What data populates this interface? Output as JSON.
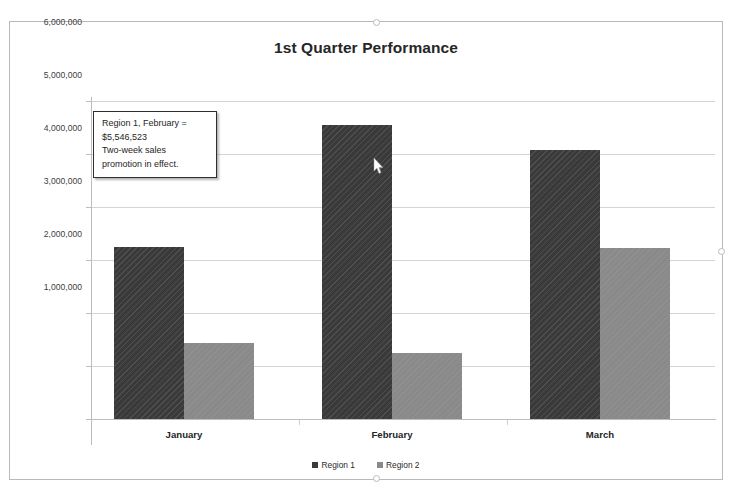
{
  "chart_data": {
    "type": "bar",
    "title": "1st Quarter Performance",
    "xlabel": "",
    "ylabel": "",
    "categories": [
      "January",
      "February",
      "March"
    ],
    "series": [
      {
        "name": "Region 1",
        "color": "#3a3a3a",
        "values": [
          3240000,
          5546523,
          5070000
        ]
      },
      {
        "name": "Region 2",
        "color": "#8a8a8a",
        "values": [
          1430000,
          1250000,
          3220000
        ]
      }
    ],
    "ylim": [
      0,
      6000000
    ],
    "ytick_values": [
      0,
      1000000,
      2000000,
      3000000,
      4000000,
      5000000,
      6000000
    ],
    "ytick_labels": [
      "",
      "1,000,000",
      "2,000,000",
      "3,000,000",
      "4,000,000",
      "5,000,000",
      "6,000,000"
    ],
    "grid": true,
    "legend_position": "bottom",
    "annotations": [
      {
        "name": "region1-february-callout",
        "lines": [
          "Region 1, February =",
          "$5,546,523",
          "Two-week sales",
          "promotion in effect."
        ]
      }
    ]
  },
  "legend": {
    "items": [
      {
        "label": "Region 1",
        "swatch": "series-1-swatch"
      },
      {
        "label": "Region 2",
        "swatch": "series-2-swatch"
      }
    ]
  },
  "cursor": {
    "icon": "mouse-pointer-icon",
    "x": 366,
    "y": 143
  },
  "selection_handles": [
    {
      "name": "handle-top-center"
    },
    {
      "name": "handle-bottom-center"
    },
    {
      "name": "handle-middle-right"
    }
  ]
}
